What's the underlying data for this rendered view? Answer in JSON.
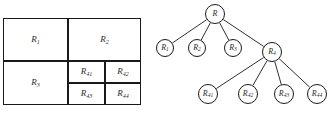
{
  "figure": {
    "colors": {
      "stroke": "#1a1a1a",
      "text": "#2b2b2b",
      "background": "#ffffff"
    }
  },
  "partition": {
    "name": "region-partition-diagram",
    "regions": [
      {
        "id": "R1",
        "label": "R",
        "sub": "1",
        "x": 3,
        "y": 18,
        "w": 65,
        "h": 43
      },
      {
        "id": "R2",
        "label": "R",
        "sub": "2",
        "x": 68,
        "y": 18,
        "w": 73,
        "h": 43
      },
      {
        "id": "R3",
        "label": "R",
        "sub": "3",
        "x": 3,
        "y": 61,
        "w": 65,
        "h": 44
      },
      {
        "id": "R41",
        "label": "R",
        "sub": "41",
        "x": 68,
        "y": 61,
        "w": 37,
        "h": 22
      },
      {
        "id": "R42",
        "label": "R",
        "sub": "42",
        "x": 105,
        "y": 61,
        "w": 36,
        "h": 22
      },
      {
        "id": "R43",
        "label": "R",
        "sub": "43",
        "x": 68,
        "y": 83,
        "w": 37,
        "h": 22
      },
      {
        "id": "R44",
        "label": "R",
        "sub": "44",
        "x": 105,
        "y": 83,
        "w": 36,
        "h": 22
      }
    ]
  },
  "tree": {
    "name": "region-hierarchy-tree",
    "node_radius": 10,
    "nodes": [
      {
        "id": "R",
        "label": "R",
        "sub": "",
        "cx": 55,
        "cy": 14,
        "r": 10
      },
      {
        "id": "R1",
        "label": "R",
        "sub": "1",
        "cx": 5,
        "cy": 48,
        "r": 9
      },
      {
        "id": "R2",
        "label": "R",
        "sub": "2",
        "cx": 37,
        "cy": 48,
        "r": 9
      },
      {
        "id": "R3",
        "label": "R",
        "sub": "3",
        "cx": 73,
        "cy": 48,
        "r": 9
      },
      {
        "id": "R4",
        "label": "R",
        "sub": "4",
        "cx": 112,
        "cy": 52,
        "r": 10
      },
      {
        "id": "R41",
        "label": "R",
        "sub": "41",
        "cx": 48,
        "cy": 94,
        "r": 10
      },
      {
        "id": "R42",
        "label": "R",
        "sub": "42",
        "cx": 88,
        "cy": 94,
        "r": 10
      },
      {
        "id": "R43",
        "label": "R",
        "sub": "43",
        "cx": 124,
        "cy": 94,
        "r": 10
      },
      {
        "id": "R44",
        "label": "R",
        "sub": "44",
        "cx": 157,
        "cy": 94,
        "r": 10
      }
    ],
    "edges": [
      {
        "from": "R",
        "to": "R1"
      },
      {
        "from": "R",
        "to": "R2"
      },
      {
        "from": "R",
        "to": "R3"
      },
      {
        "from": "R",
        "to": "R4"
      },
      {
        "from": "R4",
        "to": "R41"
      },
      {
        "from": "R4",
        "to": "R42"
      },
      {
        "from": "R4",
        "to": "R43"
      },
      {
        "from": "R4",
        "to": "R44"
      }
    ]
  }
}
